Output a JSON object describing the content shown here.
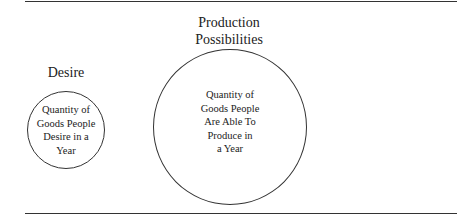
{
  "diagram": {
    "left": {
      "title": "Desire",
      "text_lines": [
        "Quantity of",
        "Goods People",
        "Desire in a",
        "Year"
      ]
    },
    "right": {
      "title_lines": [
        "Production",
        "Possibilities"
      ],
      "text_lines": [
        "Quantity of",
        "Goods People",
        "Are Able To",
        "Produce in",
        "a Year"
      ]
    }
  }
}
